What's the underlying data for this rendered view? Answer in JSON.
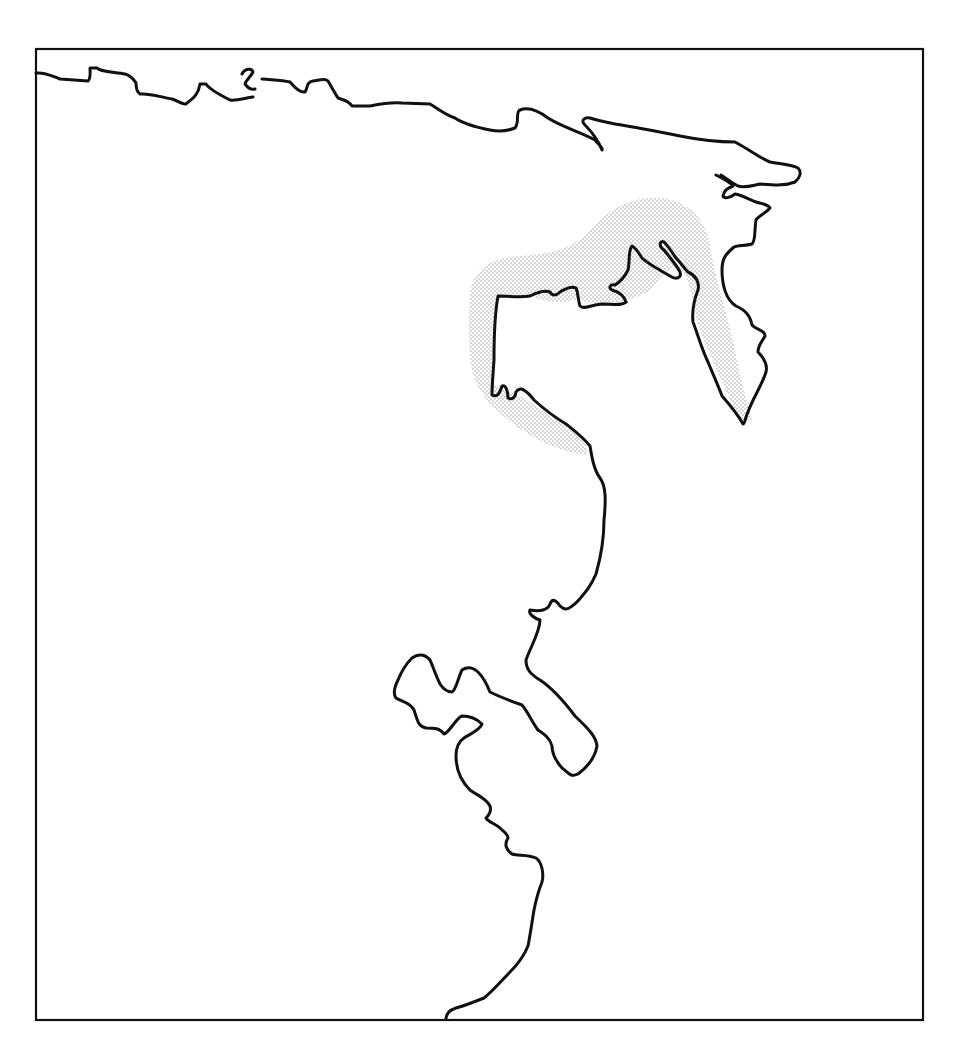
{
  "map": {
    "type": "coastline-outline-map",
    "background_color": "#ffffff",
    "line_color": "#111111",
    "stipple_color": "#9a9a9a",
    "frame": {
      "x": 36,
      "y": 49,
      "width": 887,
      "height": 971
    },
    "layers": [
      {
        "name": "northern-coastline",
        "style": "line"
      },
      {
        "name": "eastern-peninsula",
        "style": "line"
      },
      {
        "name": "central-peninsula-coast",
        "style": "line"
      },
      {
        "name": "southern-bay-coast",
        "style": "line"
      },
      {
        "name": "highlighted-coastal-zone",
        "style": "stipple"
      }
    ],
    "labels": []
  }
}
